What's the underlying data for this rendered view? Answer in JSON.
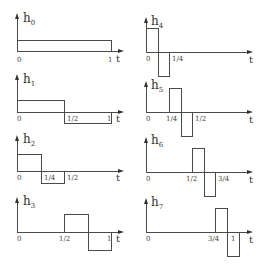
{
  "axis_label": "t",
  "origin_label": "0",
  "plots": [
    {
      "name": "h0",
      "letter": "h",
      "sub": "0",
      "ticks": [
        "1"
      ],
      "segments": [
        [
          0,
          1,
          1
        ]
      ]
    },
    {
      "name": "h1",
      "letter": "h",
      "sub": "1",
      "ticks": [
        "1/2",
        "1"
      ],
      "segments": [
        [
          0,
          0.5,
          1
        ],
        [
          0.5,
          1,
          -1
        ]
      ]
    },
    {
      "name": "h2",
      "letter": "h",
      "sub": "2",
      "ticks": [
        "1/4",
        "1/2"
      ],
      "segments": [
        [
          0,
          0.25,
          1
        ],
        [
          0.25,
          0.5,
          -1
        ]
      ]
    },
    {
      "name": "h3",
      "letter": "h",
      "sub": "3",
      "ticks": [
        "1/2",
        "1"
      ],
      "segments": [
        [
          0.5,
          0.75,
          1
        ],
        [
          0.75,
          1,
          -1
        ]
      ]
    },
    {
      "name": "h4",
      "letter": "h",
      "sub": "4",
      "ticks": [
        "1/4"
      ],
      "segments": [
        [
          0,
          0.125,
          1
        ],
        [
          0.125,
          0.25,
          -1
        ]
      ]
    },
    {
      "name": "h5",
      "letter": "h",
      "sub": "5",
      "ticks": [
        "1/4",
        "1/2"
      ],
      "segments": [
        [
          0.25,
          0.375,
          1
        ],
        [
          0.375,
          0.5,
          -1
        ]
      ]
    },
    {
      "name": "h6",
      "letter": "h",
      "sub": "6",
      "ticks": [
        "1/2",
        "3/4"
      ],
      "segments": [
        [
          0.5,
          0.625,
          1
        ],
        [
          0.625,
          0.75,
          -1
        ]
      ]
    },
    {
      "name": "h7",
      "letter": "h",
      "sub": "7",
      "ticks": [
        "3/4",
        "1"
      ],
      "segments": [
        [
          0.75,
          0.875,
          1
        ],
        [
          0.875,
          1,
          -1
        ]
      ]
    }
  ],
  "colors": {
    "stroke": "#4a4a4a",
    "text": "#333333",
    "background": "#ffffff"
  }
}
